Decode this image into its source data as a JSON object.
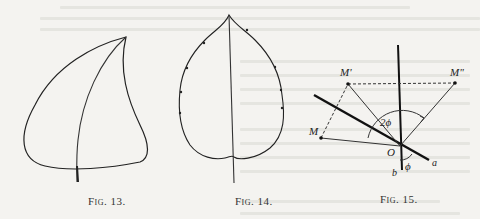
{
  "page": {
    "type": "scanned-book-page",
    "show_through_text_fragment": "see that the dorsal part of the"
  },
  "figures": [
    {
      "id": "fig13",
      "caption": "Fig. 13.",
      "depicts": "asymmetric leaf outline with curved midrib and petiole"
    },
    {
      "id": "fig14",
      "caption": "Fig. 14.",
      "depicts": "symmetric cordate leaf outline with straight midrib and small marginal points"
    },
    {
      "id": "fig15",
      "caption": "Fig. 15.",
      "depicts": "geometric reflection diagram",
      "labels": {
        "point_m": "M",
        "point_m_prime": "M'",
        "point_m_double_prime": "M\"",
        "origin": "O",
        "line_a": "a",
        "line_b": "b",
        "angle_double": "2ϕ",
        "angle_single": "ϕ"
      }
    }
  ]
}
